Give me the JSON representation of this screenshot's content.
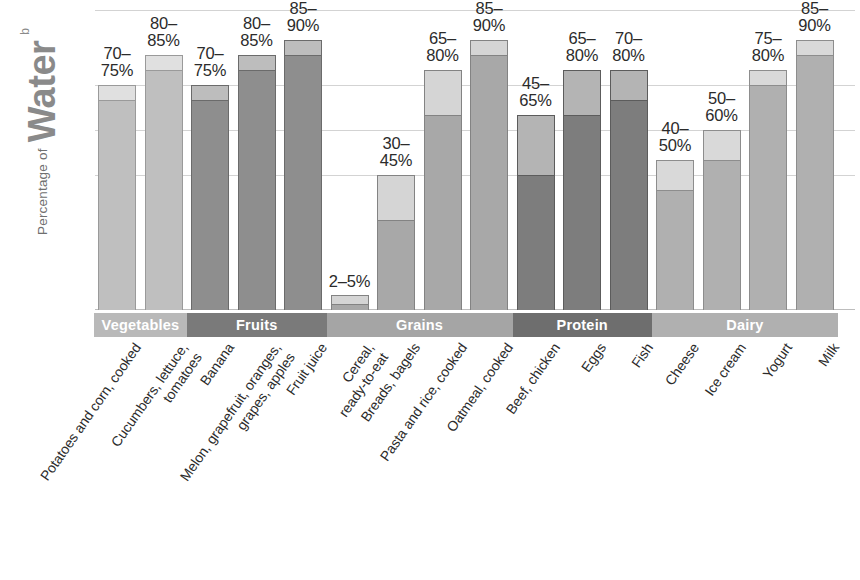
{
  "axis": {
    "y_title_prefix": "Percentage of",
    "y_title_main": "Water",
    "y_title_superscript": "b"
  },
  "groups": [
    {
      "name": "Vegetables",
      "color": "#b9b9b9",
      "start_index": 0,
      "span": 2
    },
    {
      "name": "Fruits",
      "color": "#7a7a7a",
      "start_index": 2,
      "span": 3
    },
    {
      "name": "Grains",
      "color": "#a5a5a5",
      "start_index": 5,
      "span": 4
    },
    {
      "name": "Protein",
      "color": "#6e6e6e",
      "start_index": 9,
      "span": 3
    },
    {
      "name": "Dairy",
      "color": "#b0b0b0",
      "start_index": 12,
      "span": 4
    }
  ],
  "chart_data": {
    "type": "bar",
    "title": "Percentage of Water",
    "xlabel": "",
    "ylabel": "Percentage of Water",
    "ylim": [
      0,
      100
    ],
    "grid": true,
    "legend": "none",
    "note": "Each bar is a range: the darker lower segment ends at the minimum percentage, the lighter upper segment extends to the maximum percentage.",
    "gridline_values": [
      100,
      75,
      60,
      45
    ],
    "categories": [
      "Potatoes and corn, cooked",
      "Cucumbers, lettuce, tomatoes",
      "Banana",
      "Melon, grapefruit, oranges, grapes, apples",
      "Fruit juice",
      "Cereal, ready-to-eat",
      "Breads, bagels",
      "Pasta and rice, cooked",
      "Oatmeal, cooked",
      "Beef, chicken",
      "Eggs",
      "Fish",
      "Cheese",
      "Ice cream",
      "Yogurt",
      "Milk"
    ],
    "category_lines": [
      [
        "Potatoes and corn, cooked"
      ],
      [
        "Cucumbers, lettuce,",
        "tomatoes"
      ],
      [
        "Banana"
      ],
      [
        "Melon, grapefruit, oranges,",
        "grapes, apples"
      ],
      [
        "Fruit juice"
      ],
      [
        "Cereal,",
        "ready-to-eat"
      ],
      [
        "Breads, bagels"
      ],
      [
        "Pasta and rice, cooked"
      ],
      [
        "Oatmeal, cooked"
      ],
      [
        "Beef, chicken"
      ],
      [
        "Eggs"
      ],
      [
        "Fish"
      ],
      [
        "Cheese"
      ],
      [
        "Ice cream"
      ],
      [
        "Yogurt"
      ],
      [
        "Milk"
      ]
    ],
    "series": [
      {
        "name": "Minimum percentage of water",
        "values": [
          70,
          80,
          70,
          80,
          85,
          2,
          30,
          65,
          85,
          45,
          65,
          70,
          40,
          50,
          75,
          85
        ]
      },
      {
        "name": "Maximum percentage of water",
        "values": [
          75,
          85,
          75,
          85,
          90,
          5,
          45,
          80,
          90,
          65,
          80,
          80,
          50,
          60,
          80,
          90
        ]
      }
    ],
    "value_labels": [
      [
        "70–",
        "75%"
      ],
      [
        "80–",
        "85%"
      ],
      [
        "70–",
        "75%"
      ],
      [
        "80–",
        "85%"
      ],
      [
        "85–",
        "90%"
      ],
      [
        "2–5%"
      ],
      [
        "30–",
        "45%"
      ],
      [
        "65–",
        "80%"
      ],
      [
        "85–",
        "90%"
      ],
      [
        "45–",
        "65%"
      ],
      [
        "65–",
        "80%"
      ],
      [
        "70–",
        "80%"
      ],
      [
        "40–",
        "50%"
      ],
      [
        "50–",
        "60%"
      ],
      [
        "75–",
        "80%"
      ],
      [
        "85–",
        "90%"
      ]
    ],
    "group_of_category": [
      "Vegetables",
      "Vegetables",
      "Fruits",
      "Fruits",
      "Fruits",
      "Grains",
      "Grains",
      "Grains",
      "Grains",
      "Protein",
      "Protein",
      "Protein",
      "Dairy",
      "Dairy",
      "Dairy",
      "Dairy"
    ]
  }
}
